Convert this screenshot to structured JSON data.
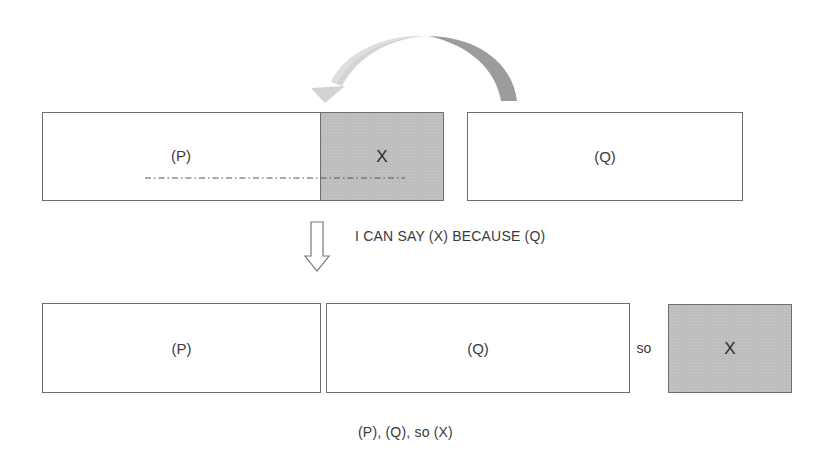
{
  "diagram": {
    "top_row": {
      "p_box": {
        "label": "(P)"
      },
      "x_box": {
        "label": "X",
        "fill": "#bdbdbd"
      },
      "q_box": {
        "label": "(Q)"
      },
      "curved_arrow": {
        "from": "q_box",
        "to": "x_box",
        "tail_color": "#9a9a9a",
        "head_color": "#d6d6d6"
      },
      "dashed_line": {
        "style": "dash-dot"
      }
    },
    "transition": {
      "arrow": "down",
      "caption": "I CAN SAY (X) BECAUSE (Q)"
    },
    "bottom_row": {
      "p_box": {
        "label": "(P)"
      },
      "q_box": {
        "label": "(Q)"
      },
      "connector": "so",
      "x_box": {
        "label": "X",
        "fill": "#bdbdbd"
      }
    },
    "summary": "(P), (Q), so (X)"
  }
}
